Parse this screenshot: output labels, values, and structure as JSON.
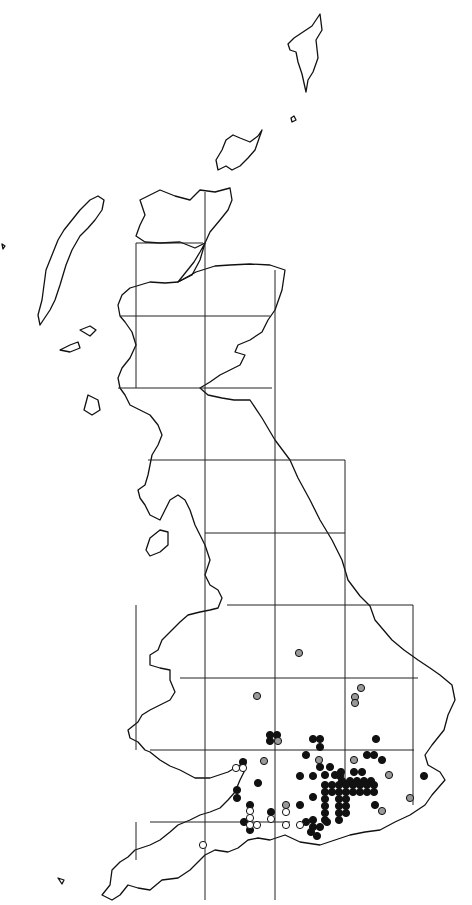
{
  "map": {
    "type": "distribution-map",
    "region": "Great Britain",
    "width": 472,
    "height": 905,
    "colors": {
      "background": "#ffffff",
      "outline": "#111111",
      "grid": "#222222",
      "record_recent": "#111111",
      "record_older": "#999999",
      "record_historic": "#ffffff"
    },
    "grid": {
      "vertical": [
        {
          "x": 136,
          "y1": 243,
          "y2": 388
        },
        {
          "x": 205,
          "y1": 192,
          "y2": 900
        },
        {
          "x": 275,
          "y1": 270,
          "y2": 900
        },
        {
          "x": 345,
          "y1": 460,
          "y2": 790
        },
        {
          "x": 413,
          "y1": 605,
          "y2": 805
        },
        {
          "x": 136,
          "y1": 605,
          "y2": 750
        },
        {
          "x": 136,
          "y1": 822,
          "y2": 860
        }
      ],
      "horizontal": [
        {
          "y": 243,
          "x1": 136,
          "x2": 203
        },
        {
          "y": 316,
          "x1": 120,
          "x2": 270
        },
        {
          "y": 388,
          "x1": 118,
          "x2": 272
        },
        {
          "y": 460,
          "x1": 148,
          "x2": 345
        },
        {
          "y": 533,
          "x1": 205,
          "x2": 345
        },
        {
          "y": 605,
          "x1": 227,
          "x2": 413
        },
        {
          "y": 678,
          "x1": 180,
          "x2": 418
        },
        {
          "y": 750,
          "x1": 150,
          "x2": 414
        },
        {
          "y": 822,
          "x1": 150,
          "x2": 290
        }
      ]
    },
    "records": {
      "black": [
        [
          270,
          735
        ],
        [
          277,
          735
        ],
        [
          270,
          741
        ],
        [
          313,
          739
        ],
        [
          320,
          739
        ],
        [
          320,
          747
        ],
        [
          376,
          739
        ],
        [
          306,
          755
        ],
        [
          367,
          755
        ],
        [
          374,
          755
        ],
        [
          382,
          760
        ],
        [
          243,
          762
        ],
        [
          320,
          767
        ],
        [
          330,
          767
        ],
        [
          325,
          775
        ],
        [
          335,
          775
        ],
        [
          300,
          776
        ],
        [
          313,
          776
        ],
        [
          340,
          776
        ],
        [
          341,
          772
        ],
        [
          354,
          772
        ],
        [
          362,
          772
        ],
        [
          342,
          781
        ],
        [
          350,
          781
        ],
        [
          357,
          781
        ],
        [
          364,
          781
        ],
        [
          371,
          781
        ],
        [
          325,
          785
        ],
        [
          332,
          785
        ],
        [
          339,
          785
        ],
        [
          346,
          785
        ],
        [
          353,
          785
        ],
        [
          360,
          785
        ],
        [
          367,
          785
        ],
        [
          374,
          785
        ],
        [
          325,
          792
        ],
        [
          332,
          792
        ],
        [
          339,
          792
        ],
        [
          346,
          792
        ],
        [
          353,
          792
        ],
        [
          360,
          792
        ],
        [
          367,
          792
        ],
        [
          374,
          792
        ],
        [
          325,
          799
        ],
        [
          339,
          799
        ],
        [
          346,
          799
        ],
        [
          258,
          783
        ],
        [
          424,
          776
        ],
        [
          237,
          790
        ],
        [
          237,
          798
        ],
        [
          325,
          806
        ],
        [
          339,
          806
        ],
        [
          346,
          806
        ],
        [
          313,
          797
        ],
        [
          325,
          813
        ],
        [
          339,
          813
        ],
        [
          346,
          813
        ],
        [
          300,
          805
        ],
        [
          375,
          805
        ],
        [
          250,
          805
        ],
        [
          271,
          812
        ],
        [
          325,
          820
        ],
        [
          339,
          820
        ],
        [
          313,
          820
        ],
        [
          244,
          822
        ],
        [
          250,
          830
        ],
        [
          306,
          822
        ],
        [
          313,
          827
        ],
        [
          320,
          827
        ],
        [
          327,
          822
        ],
        [
          311,
          832
        ],
        [
          317,
          836
        ]
      ],
      "grey": [
        [
          299,
          653
        ],
        [
          257,
          696
        ],
        [
          361,
          688
        ],
        [
          355,
          697
        ],
        [
          355,
          703
        ],
        [
          278,
          741
        ],
        [
          264,
          761
        ],
        [
          319,
          760
        ],
        [
          354,
          760
        ],
        [
          389,
          775
        ],
        [
          286,
          805
        ],
        [
          410,
          798
        ],
        [
          382,
          811
        ]
      ],
      "white": [
        [
          236,
          768
        ],
        [
          243,
          768
        ],
        [
          250,
          811
        ],
        [
          250,
          818
        ],
        [
          250,
          825
        ],
        [
          257,
          825
        ],
        [
          271,
          819
        ],
        [
          286,
          812
        ],
        [
          286,
          825
        ],
        [
          300,
          825
        ],
        [
          203,
          845
        ]
      ]
    },
    "coastline_paths": [
      "M320,14 L322,30 L316,40 L318,58 L313,72 L308,80 L306,92 L302,74 L298,62 L296,52 L290,50 L288,44 L294,38 L300,34 L306,30 L312,26 Z",
      "M291,118 L294,116 L296,120 L292,122 Z",
      "M233,135 L240,138 L250,142 L258,136 L262,130 L255,150 L248,158 L240,166 L232,170 L226,166 L218,170 L216,160 L222,150 L226,140 Z",
      "M140,200 L160,190 L175,196 L190,200 L200,190 L215,192 L230,188 L232,200 L228,210 L220,220 L210,232 L205,243 L195,248 L180,242 L160,243 L145,242 L136,236 L140,225 L145,215 Z",
      "M205,243 L200,260 L192,275 L178,282 L186,272 L194,262 L200,252 Z",
      "M178,282 L196,272 L215,266 L230,265 L250,264 L270,265 L285,270 L282,290 L275,310 L268,320 L262,332 L250,340 L238,345 L235,352 L245,355 L240,365 L230,370 L220,375 L210,382 L200,388 L208,395 L222,398 L234,400 L250,400 L262,418 L275,440 L290,460 L298,478 L310,500 L320,520 L332,540 L342,560 L348,580 L360,596 L370,606 L375,620 L392,640 L404,650 L418,660 L430,668 L440,675 L452,685 L455,700 L448,715 L444,730 L432,745 L425,755 L428,765 L440,772 L445,780 L432,795 L425,805 L410,815 L395,822 L380,830 L365,832 L350,835 L335,840 L320,845 L300,842 L285,835 L270,840 L258,838 L248,840 L238,848 L228,852 L215,850 L205,855 L190,870 L178,878 L162,880 L150,890 L138,888 L128,885 L120,895 L112,900 L102,895 L110,885 L112,870 L120,862 L128,857 L135,850 L150,845 L160,840 L170,832 L178,825 L190,820 L200,815 L210,812 L220,808 L228,800 L235,792 L240,780 L245,770 L246,760 L240,765 L228,772 L210,778 L195,778 L180,770 L170,766 L160,760 L150,752 L145,750 L138,742 L130,738 L128,730 L138,722 L142,715 L150,710 L160,705 L170,700 L175,692 L170,680 L170,670 L160,668 L150,665 L150,655 L158,650 L162,640 L172,630 L180,622 L188,615 L200,612 L210,610 L218,608 L222,598 L218,590 L210,585 L205,575 L210,560 L205,545 L200,535 L195,525 L190,510 L185,500 L178,495 L170,500 L165,510 L160,520 L150,515 L145,505 L140,498 L138,490 L145,485 L148,475 L150,465 L152,455 L158,445 L162,435 L158,425 L150,415 L140,410 L130,405 L125,395 L120,388 L118,378 L122,368 L130,358 L136,345 L132,332 L125,322 L120,316 L118,305 L122,295 L130,288 L140,285 L150,282 L165,283 Z",
      "M40,325 L50,310 L55,300 L60,285 L66,265 L72,250 L80,236 L88,228 L95,220 L102,210 L104,200 L98,196 L90,200 L80,210 L72,220 L64,230 L58,240 L52,255 L46,270 L44,285 L42,300 L38,315 Z",
      "M150,538 L160,530 L168,532 L168,545 L160,552 L150,556 L146,550 Z",
      "M60,350 L70,345 L78,342 L80,348 L70,352 Z",
      "M80,330 L90,326 L96,330 L90,336 Z",
      "M88,395 L98,400 L100,410 L92,415 L84,410 Z",
      "M58,878 L64,880 L62,884 Z",
      "M2,244 L5,246 L3,249 Z"
    ]
  }
}
